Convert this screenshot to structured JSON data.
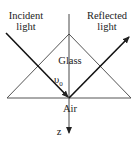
{
  "diagram": {
    "labels": {
      "incident_line1": "Incident",
      "incident_line2": "light",
      "reflected_line1": "Reflected",
      "reflected_line2": "light",
      "glass": "Glass",
      "angle": "υ",
      "angle_sub": "0",
      "air": "Air",
      "axis": "z"
    },
    "colors": {
      "line": "#222222",
      "prism": "#444444"
    }
  }
}
